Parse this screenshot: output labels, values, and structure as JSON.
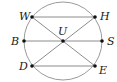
{
  "diagram": {
    "type": "geometry-circle",
    "colors": {
      "circle": "#9a9a9a",
      "line": "#8c8c8c",
      "point": "#111111",
      "label": "#1a1a1a"
    },
    "circle": {
      "cx": 63,
      "cy": 41,
      "r": 39
    },
    "points": [
      {
        "id": "W",
        "label": "W",
        "x": 32,
        "y": 17,
        "lx": 19,
        "ly": 20
      },
      {
        "id": "H",
        "label": "H",
        "x": 95,
        "y": 17,
        "lx": 100,
        "ly": 20
      },
      {
        "id": "B",
        "label": "B",
        "x": 24,
        "y": 41,
        "lx": 11,
        "ly": 45
      },
      {
        "id": "U",
        "label": "U",
        "x": 63,
        "y": 41,
        "lx": 58,
        "ly": 35
      },
      {
        "id": "S",
        "label": "S",
        "x": 102,
        "y": 41,
        "lx": 107,
        "ly": 45
      },
      {
        "id": "D",
        "label": "D",
        "x": 32,
        "y": 66,
        "lx": 19,
        "ly": 70
      },
      {
        "id": "E",
        "label": "E",
        "x": 95,
        "y": 66,
        "lx": 99,
        "ly": 74
      }
    ],
    "segments": [
      [
        "W",
        "H"
      ],
      [
        "B",
        "S"
      ],
      [
        "D",
        "E"
      ],
      [
        "W",
        "E"
      ],
      [
        "H",
        "D"
      ]
    ]
  }
}
